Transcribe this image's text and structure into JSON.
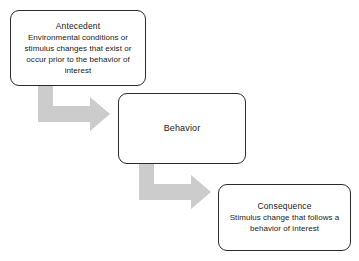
{
  "diagram": {
    "background_color": "#ffffff",
    "box_border_color": "#2b2b2b",
    "box_fill_color": "#ffffff",
    "arrow_color": "#cccccc",
    "text_color": "#1a1a1a"
  },
  "nodes": [
    {
      "id": "antecedent",
      "title": "Antecedent",
      "body": "Environmental conditions or stimulus changes that exist or occur prior to the behavior of interest"
    },
    {
      "id": "behavior",
      "title": "Behavior",
      "body": ""
    },
    {
      "id": "consequence",
      "title": "Consequence",
      "body": "Stimulus change that follows a behavior of interest"
    }
  ],
  "connectors": [
    {
      "id": "antecedent-to-behavior",
      "from": "antecedent",
      "to": "behavior",
      "shape": "elbow-down-right",
      "color": "#cccccc"
    },
    {
      "id": "behavior-to-consequence",
      "from": "behavior",
      "to": "consequence",
      "shape": "elbow-down-right",
      "color": "#cccccc"
    }
  ]
}
